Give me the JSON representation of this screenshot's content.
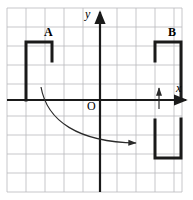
{
  "figure": {
    "background_color": "#ffffff",
    "grid": {
      "color": "#b9b9bd",
      "line_width": 0.8,
      "spacing_px": 19.4,
      "x_min_px": 7,
      "x_max_px": 182,
      "y_min_px": 8,
      "y_max_px": 192,
      "columns": 9,
      "rows": 9,
      "visible": true
    },
    "axes": {
      "color": "#1a1a1a",
      "line_width": 2.2,
      "x_axis": {
        "label": "x",
        "y_px": 100,
        "start_px": 7,
        "end_px": 188,
        "arrow": "right"
      },
      "y_axis": {
        "label": "y",
        "x_px": 100,
        "start_px": 192,
        "end_px": 10,
        "arrow": "up"
      },
      "origin_label": "O"
    },
    "shapes": [
      {
        "name": "A",
        "label": "A",
        "label_x_px": 44,
        "label_y_px": 26,
        "type": "open-bracket-down",
        "description": "Bracket opening downward; left leg long reaching x-axis, right leg short",
        "stroke_color": "#1a1a1a",
        "stroke_width": 3,
        "points_px": [
          [
            26,
            100
          ],
          [
            26,
            42
          ],
          [
            52,
            42
          ],
          [
            52,
            61
          ]
        ]
      },
      {
        "name": "B",
        "label": "B",
        "label_x_px": 168,
        "label_y_px": 26,
        "type": "open-bracket-down",
        "description": "Bracket opening downward; left leg short, right leg long reaching x-axis",
        "stroke_color": "#1a1a1a",
        "stroke_width": 3,
        "points_px": [
          [
            155,
            61
          ],
          [
            155,
            42
          ],
          [
            181,
            42
          ],
          [
            181,
            100
          ]
        ]
      },
      {
        "name": "B-image",
        "label": "",
        "type": "open-bracket-up",
        "description": "U shape opening upward below the x-axis at lower right",
        "stroke_color": "#1a1a1a",
        "stroke_width": 3,
        "points_px": [
          [
            155,
            120
          ],
          [
            155,
            158
          ],
          [
            181,
            158
          ],
          [
            181,
            119
          ]
        ]
      }
    ],
    "arrows": [
      {
        "name": "curved-transformation-arrow",
        "type": "curved",
        "color": "#2a2a2a",
        "stroke_width": 1.2,
        "start_px": [
          41,
          87
        ],
        "control_px": [
          58,
          148
        ],
        "end_px": [
          139,
          143
        ],
        "arrowhead": "end"
      },
      {
        "name": "vertical-translation-arrow",
        "type": "straight",
        "color": "#2a2a2a",
        "stroke_width": 1.2,
        "start_px": [
          159,
          108
        ],
        "end_px": [
          159,
          86
        ],
        "arrowhead": "end-up"
      }
    ]
  }
}
